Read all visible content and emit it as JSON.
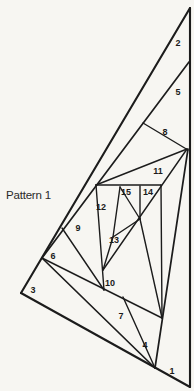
{
  "title": {
    "text": "Pattern 1"
  },
  "canvas": {
    "width": 194,
    "height": 391,
    "background": "#f7f6f2",
    "line_color": "#1c1c1c",
    "label_color": "#1b1b1b",
    "label_font_size": 9
  },
  "figure": {
    "segments": [
      {
        "name": "left-edge",
        "x1": 190,
        "y1": 8,
        "x2": 21,
        "y2": 293,
        "w": 2.1
      },
      {
        "name": "right-edge",
        "x1": 190,
        "y1": 8,
        "x2": 190,
        "y2": 387,
        "w": 2.1
      },
      {
        "name": "bottom-edge",
        "x1": 21,
        "y1": 293,
        "x2": 190,
        "y2": 387,
        "w": 2.1
      },
      {
        "name": "chord-1",
        "x1": 155,
        "y1": 368,
        "x2": 188,
        "y2": 149,
        "w": 1.7
      },
      {
        "name": "chord-2",
        "x1": 189,
        "y1": 62,
        "x2": 42,
        "y2": 258,
        "w": 1.7
      },
      {
        "name": "chord-3",
        "x1": 42,
        "y1": 258,
        "x2": 155,
        "y2": 368,
        "w": 1.7
      },
      {
        "name": "chord-7",
        "x1": 42,
        "y1": 258,
        "x2": 162,
        "y2": 318,
        "w": 1.4
      },
      {
        "name": "chord-4",
        "x1": 123,
        "y1": 297,
        "x2": 155,
        "y2": 368,
        "w": 1.4
      },
      {
        "name": "chord-5",
        "x1": 143,
        "y1": 123,
        "x2": 188,
        "y2": 150,
        "w": 1.4
      },
      {
        "name": "chord-6",
        "x1": 62,
        "y1": 228,
        "x2": 104,
        "y2": 290,
        "w": 1.4
      },
      {
        "name": "chord-8",
        "x1": 96,
        "y1": 185,
        "x2": 187,
        "y2": 149,
        "w": 1.4
      },
      {
        "name": "chord-9",
        "x1": 96,
        "y1": 185,
        "x2": 104,
        "y2": 290,
        "w": 1.4
      },
      {
        "name": "chord-11",
        "x1": 96,
        "y1": 185,
        "x2": 161,
        "y2": 185,
        "w": 1.4
      },
      {
        "name": "chord-14-long",
        "x1": 187,
        "y1": 149,
        "x2": 103,
        "y2": 270,
        "w": 1.4
      },
      {
        "name": "chord-10-inner",
        "x1": 161,
        "y1": 185,
        "x2": 162,
        "y2": 318,
        "w": 1.4
      },
      {
        "name": "chord-10",
        "x1": 140,
        "y1": 219,
        "x2": 162,
        "y2": 318,
        "w": 1.4
      },
      {
        "name": "chord-14-vert",
        "x1": 140,
        "y1": 186,
        "x2": 140,
        "y2": 219,
        "w": 1.4
      },
      {
        "name": "chord-15",
        "x1": 120,
        "y1": 187,
        "x2": 113,
        "y2": 237,
        "w": 1.4
      },
      {
        "name": "chord-15-hyp",
        "x1": 120,
        "y1": 187,
        "x2": 140,
        "y2": 219,
        "w": 1.4
      },
      {
        "name": "aperture-edge-a",
        "x1": 140,
        "y1": 219,
        "x2": 113,
        "y2": 237,
        "w": 1.4
      },
      {
        "name": "aperture-edge-b",
        "x1": 113,
        "y1": 237,
        "x2": 103,
        "y2": 270,
        "w": 1.4
      }
    ],
    "labels": [
      {
        "text": "1",
        "x": 172,
        "y": 371
      },
      {
        "text": "2",
        "x": 178,
        "y": 43
      },
      {
        "text": "3",
        "x": 33,
        "y": 290
      },
      {
        "text": "4",
        "x": 145,
        "y": 345
      },
      {
        "text": "5",
        "x": 178,
        "y": 92
      },
      {
        "text": "6",
        "x": 53,
        "y": 256
      },
      {
        "text": "7",
        "x": 121,
        "y": 316
      },
      {
        "text": "8",
        "x": 165,
        "y": 132
      },
      {
        "text": "9",
        "x": 78,
        "y": 228
      },
      {
        "text": "10",
        "x": 110,
        "y": 283
      },
      {
        "text": "11",
        "x": 158,
        "y": 171
      },
      {
        "text": "12",
        "x": 101,
        "y": 207
      },
      {
        "text": "13",
        "x": 114,
        "y": 240
      },
      {
        "text": "14",
        "x": 148,
        "y": 192
      },
      {
        "text": "15",
        "x": 126,
        "y": 192
      }
    ]
  }
}
